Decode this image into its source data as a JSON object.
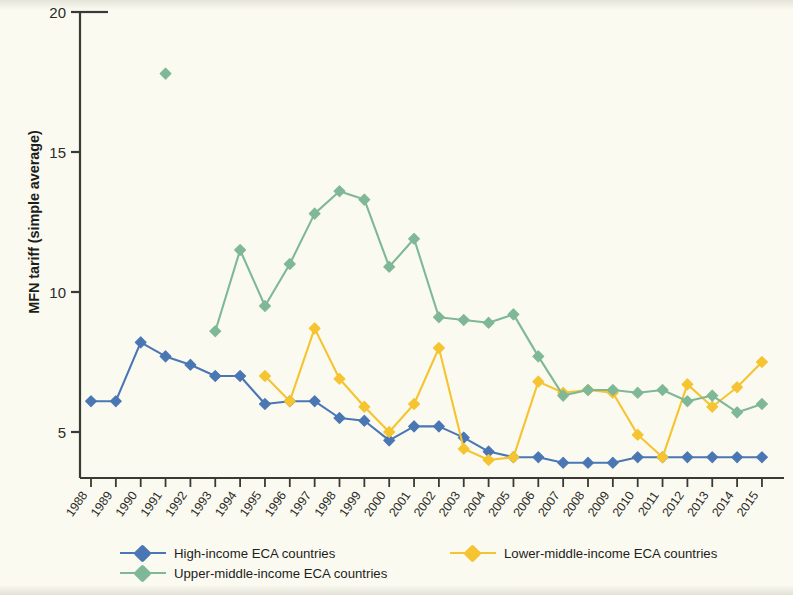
{
  "chart_data": {
    "type": "line",
    "title": "",
    "xlabel": "",
    "ylabel": "MFN tariff (simple average)",
    "ylim": [
      0,
      20
    ],
    "yticks": [
      5,
      10,
      15,
      20
    ],
    "grid": false,
    "legend_position": "bottom",
    "marker": "diamond",
    "categories": [
      "1988",
      "1989",
      "1990",
      "1991",
      "1992",
      "1993",
      "1994",
      "1995",
      "1996",
      "1997",
      "1998",
      "1999",
      "2000",
      "2001",
      "2002",
      "2003",
      "2004",
      "2005",
      "2006",
      "2007",
      "2008",
      "2009",
      "2010",
      "2011",
      "2012",
      "2013",
      "2014",
      "2015"
    ],
    "series": [
      {
        "name": "High-income ECA countries",
        "color": "#4a77b4",
        "values": [
          6.1,
          6.1,
          8.2,
          7.7,
          7.4,
          7.0,
          7.0,
          6.0,
          6.1,
          6.1,
          5.5,
          5.4,
          4.7,
          5.2,
          5.2,
          4.8,
          4.3,
          4.1,
          4.1,
          3.9,
          3.9,
          3.9,
          4.1,
          4.1,
          4.1,
          4.1,
          4.1,
          4.1
        ]
      },
      {
        "name": "Lower-middle-income ECA countries",
        "color": "#f5c430",
        "values": [
          null,
          null,
          null,
          null,
          null,
          null,
          null,
          7.0,
          6.1,
          8.7,
          6.9,
          5.9,
          5.0,
          6.0,
          8.0,
          4.4,
          4.0,
          4.1,
          6.8,
          6.4,
          6.5,
          6.4,
          4.9,
          4.1,
          6.7,
          5.9,
          6.6,
          7.5
        ]
      },
      {
        "name": "Upper-middle-income ECA countries",
        "color": "#7fb896",
        "values": [
          null,
          null,
          null,
          17.8,
          null,
          8.6,
          11.5,
          9.5,
          11.0,
          12.8,
          13.6,
          13.3,
          10.9,
          11.9,
          9.1,
          9.0,
          8.9,
          9.2,
          7.7,
          6.3,
          6.5,
          6.5,
          6.4,
          6.5,
          6.1,
          6.3,
          5.7,
          6.0
        ]
      }
    ]
  },
  "axes": {
    "y_tick_labels": [
      "20",
      "15",
      "10",
      "5"
    ],
    "y_title": "MFN tariff (simple average)"
  },
  "legend": {
    "items": [
      {
        "label": "High-income ECA countries",
        "color": "#4a77b4"
      },
      {
        "label": "Lower-middle-income ECA countries",
        "color": "#f5c430"
      },
      {
        "label": "Upper-middle-income ECA countries",
        "color": "#7fb896"
      }
    ]
  },
  "colors": {
    "background": "#fbfaf1",
    "axis": "#3a3a34",
    "text": "#1d1d1b",
    "high_income": "#4a77b4",
    "lower_middle_income": "#f5c430",
    "upper_middle_income": "#7fb896"
  }
}
